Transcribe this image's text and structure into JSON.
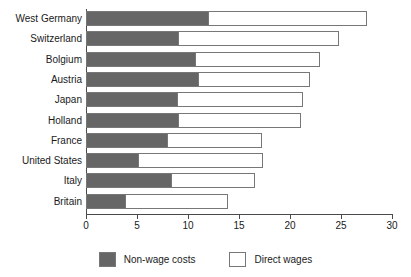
{
  "chart_data": {
    "type": "bar",
    "orientation": "horizontal",
    "stacked": true,
    "title": "",
    "subtitle": "",
    "xlabel": "",
    "ylabel": "",
    "xlim": [
      0,
      30
    ],
    "xticks": [
      0,
      5,
      10,
      15,
      20,
      25,
      30
    ],
    "xtick_labels": [
      "0",
      "5",
      "10",
      "15",
      "20",
      "25",
      "30"
    ],
    "grid": false,
    "legend_position": "bottom",
    "categories": [
      "West Germany",
      "Switzerland",
      "Bolgium",
      "Austria",
      "Japan",
      "Holland",
      "France",
      "United States",
      "Italy",
      "Britain"
    ],
    "series": [
      {
        "name": "Non-wage costs",
        "color": "#666666",
        "values": [
          12.0,
          9.1,
          10.8,
          11.1,
          9.0,
          9.1,
          8.0,
          5.2,
          8.4,
          3.9
        ]
      },
      {
        "name": "Direct wages",
        "color": "#ffffff",
        "values": [
          15.5,
          15.7,
          12.1,
          10.9,
          12.3,
          12.0,
          9.3,
          12.2,
          8.2,
          10.0
        ]
      }
    ],
    "totals": [
      27.5,
      24.8,
      22.9,
      22.0,
      21.3,
      21.1,
      17.3,
      17.4,
      16.6,
      13.9
    ]
  },
  "legend": {
    "items": [
      {
        "label": "Non-wage costs",
        "swatch": "dark-gray-swatch"
      },
      {
        "label": "Direct wages",
        "swatch": "white-swatch"
      }
    ]
  },
  "colors": {
    "nonwage": "#666666",
    "direct": "#ffffff",
    "axis": "#4a4a4a",
    "bar_border": "#777777",
    "background": "#ffffff",
    "text": "#1a1a1a"
  }
}
